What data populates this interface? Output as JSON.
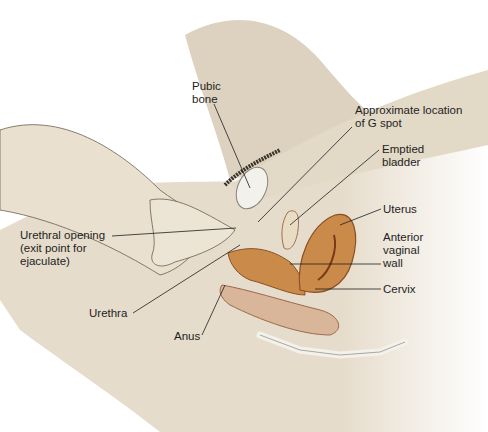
{
  "diagram": {
    "type": "anatomical-illustration",
    "labels": {
      "pubic_bone": "Pubic\nbone",
      "g_spot": "Approximate location\nof G spot",
      "bladder": "Emptied\nbladder",
      "uterus": "Uterus",
      "anterior_vaginal_wall": "Anterior\nvaginal\nwall",
      "cervix": "Cervix",
      "urethral_opening": "Urethral opening\n(exit point for\nejaculate)",
      "urethra": "Urethra",
      "anus": "Anus"
    },
    "colors": {
      "skin": "#e6dccb",
      "skin_shadow": "#cdbfa8",
      "organ": "#c98a4a",
      "organ_dark": "#8a4f22",
      "bone": "#f3f1ec",
      "bowel": "#d9b59a",
      "leader": "#1e1e1e"
    }
  }
}
